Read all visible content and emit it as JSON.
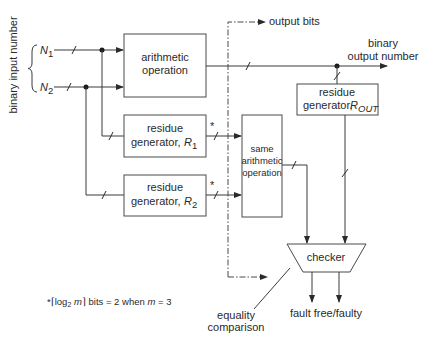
{
  "diagram": {
    "input_label": "binary input number",
    "inputs": [
      {
        "name": "N",
        "sub": "1"
      },
      {
        "name": "N",
        "sub": "2"
      }
    ],
    "blocks": {
      "arithmetic": {
        "line1": "arithmetic",
        "line2": "operation"
      },
      "residue_r1": {
        "line1": "residue",
        "line2": "generator, ",
        "var": "R",
        "sub": "1"
      },
      "residue_r2": {
        "line1": "residue",
        "line2": "generator, ",
        "var": "R",
        "sub": "2"
      },
      "same_arith": {
        "line1": "same",
        "line2": "arithmetic",
        "line3": "operation"
      },
      "residue_rout": {
        "line1": "residue",
        "line2": "generator, ",
        "var": "R",
        "sub": "OUT"
      },
      "checker": {
        "label": "checker"
      }
    },
    "labels": {
      "output_bits": "output bits",
      "binary_output_line1": "binary",
      "binary_output_line2": "output number",
      "equality_line1": "equality",
      "equality_line2": "comparison",
      "fault": "fault free/faulty",
      "star": "*",
      "footnote": {
        "star": "*",
        "pre": "⌈log",
        "sub": "2",
        "mid": " m",
        "post": "⌉ bits = 2 when ",
        "m": "m",
        "eq": " = 3"
      }
    }
  }
}
